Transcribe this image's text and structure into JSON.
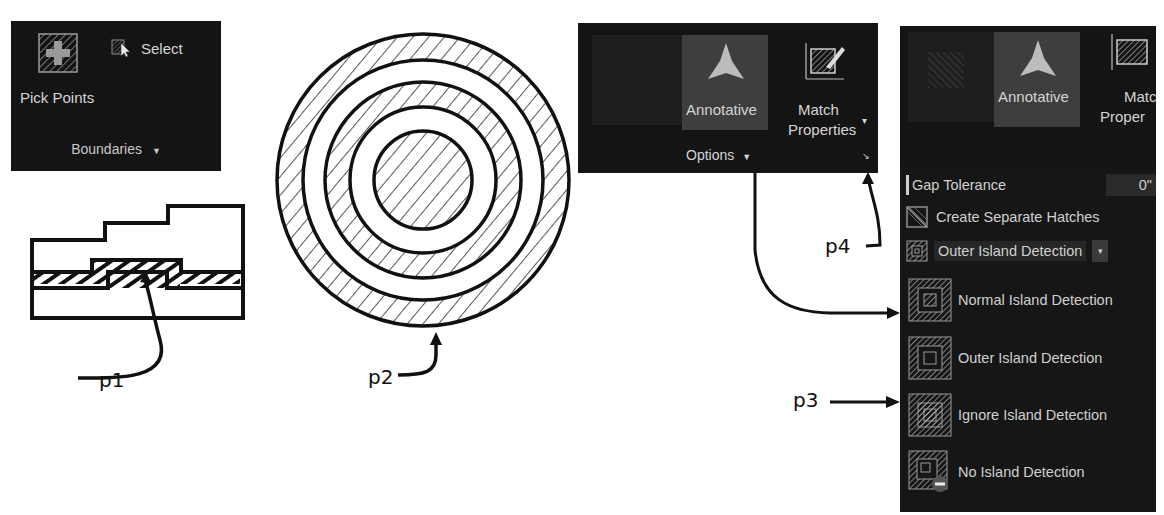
{
  "boundaries_panel": {
    "pick_points_label": "Pick Points",
    "select_label": "Select",
    "footer_label": "Boundaries",
    "footer_chevron": "▼"
  },
  "options_panel": {
    "annotative_label": "Annotative",
    "match_properties_line1": "Match",
    "match_properties_line2": "Properties",
    "match_chevron": "▾",
    "footer_label": "Options",
    "footer_chevron": "▼",
    "launcher_glyph": "↘"
  },
  "expanded_panel": {
    "annotative_label": "Annotative",
    "match_partial_line1": "Matc",
    "match_partial_line2": "Proper",
    "gap_tolerance_label": "Gap Tolerance",
    "gap_tolerance_value": "0\"",
    "create_separate_label": "Create Separate Hatches",
    "island_selected": "Outer Island Detection",
    "island_options": [
      {
        "label": "Normal Island Detection",
        "icon": "normal-island-icon"
      },
      {
        "label": "Outer Island Detection",
        "icon": "outer-island-icon"
      },
      {
        "label": "Ignore Island Detection",
        "icon": "ignore-island-icon"
      },
      {
        "label": "No Island Detection",
        "icon": "no-island-icon"
      }
    ]
  },
  "callouts": {
    "p1": "p1",
    "p2": "p2",
    "p3": "p3",
    "p4": "p4"
  }
}
